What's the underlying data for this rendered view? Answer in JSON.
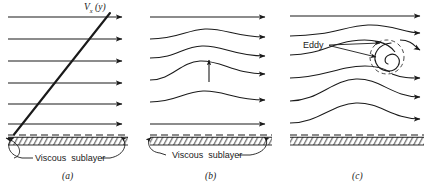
{
  "figure": {
    "title_visible": false,
    "background_color": "#ffffff",
    "line_color": "#1a1a1a",
    "panel_count": 3
  },
  "panels": [
    {
      "letter": "(a)",
      "profile_label": "V",
      "profile_label_sub": "x",
      "profile_label_arg": "(y)",
      "wall_label": "Viscous  sublayer",
      "streamline_count": 6,
      "streamline_type": "straight",
      "has_velocity_profile_line": true,
      "has_eddy": false,
      "has_vertical_arrow": false
    },
    {
      "letter": "(b)",
      "wall_label": "Viscous  sublayer",
      "streamline_count": 6,
      "streamline_type": "wavy",
      "has_velocity_profile_line": false,
      "has_eddy": false,
      "has_vertical_arrow": true
    },
    {
      "letter": "(c)",
      "wall_label": "",
      "eddy_label": "Eddy",
      "streamline_count": 6,
      "streamline_type": "wavy-with-vortex",
      "has_velocity_profile_line": false,
      "has_eddy": true,
      "has_vertical_arrow": false
    }
  ]
}
